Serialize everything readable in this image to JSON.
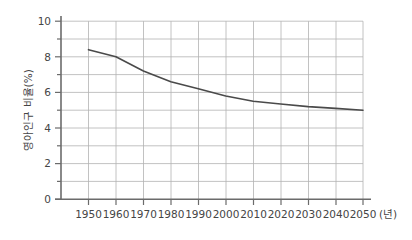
{
  "chart_data": {
    "type": "line",
    "title": "",
    "subtitle": "",
    "xlabel": "년",
    "xlabel_display": "(년)",
    "ylabel": "영아인구 비율(%)",
    "x": [
      1950,
      1960,
      1970,
      1980,
      1990,
      2000,
      2010,
      2020,
      2030,
      2040,
      2050
    ],
    "categories": [
      "1950",
      "1960",
      "1970",
      "1980",
      "1990",
      "2000",
      "2010",
      "2020",
      "2030",
      "2040",
      "2050"
    ],
    "values": [
      8.4,
      8.0,
      7.2,
      6.6,
      6.2,
      5.8,
      5.5,
      5.35,
      5.2,
      5.1,
      5.0
    ],
    "series": [
      {
        "name": "영아인구 비율(%)",
        "color": "#4a4a4a",
        "values": [
          8.4,
          8.0,
          7.2,
          6.6,
          6.2,
          5.8,
          5.5,
          5.35,
          5.2,
          5.1,
          5.0
        ]
      }
    ],
    "xlim": [
      1945,
      2055
    ],
    "ylim": [
      0,
      10
    ],
    "y_major_ticks": [
      0,
      2,
      4,
      6,
      8,
      10
    ],
    "y_major_tick_labels": [
      "0",
      "2",
      "4",
      "6",
      "8",
      "10"
    ],
    "y_minor_ticks": [
      1,
      3,
      5,
      7,
      9
    ],
    "x_grid_values": [
      1950,
      1960,
      1970,
      1980,
      1990,
      2000,
      2010,
      2020,
      2030,
      2040,
      2050
    ],
    "grid": true,
    "grid_color": "#b3b3b3",
    "axis_color": "#6b6b6b",
    "legend": false,
    "legend_position": "none"
  },
  "colors": {
    "background": "#ffffff",
    "line": "#4a4a4a",
    "grid": "#b3b3b3",
    "axis": "#6b6b6b",
    "text": "#454545"
  }
}
